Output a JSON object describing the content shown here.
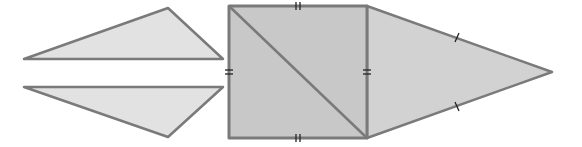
{
  "diagram": {
    "colors": {
      "stroke": "#7a7a7a",
      "light_fill": "#e2e2e2",
      "square_fill": "#c8c8c8",
      "right_fill": "#d2d2d2",
      "tick": "#222222"
    },
    "shapes": [
      {
        "id": "left-top-triangle",
        "points": "24,59 168,8 223,59",
        "fill": "light_fill"
      },
      {
        "id": "left-bottom-triangle",
        "points": "24,87 223,87 168,137",
        "fill": "light_fill"
      },
      {
        "id": "center-square",
        "points": "229,6 367,6 367,138 229,138",
        "fill": "square_fill"
      },
      {
        "id": "right-triangle",
        "points": "367,6 552,72 367,138",
        "fill": "right_fill"
      }
    ],
    "diagonal": {
      "x1": 229,
      "y1": 6,
      "x2": 367,
      "y2": 138
    },
    "tick_marks": {
      "double": [
        {
          "id": "square-top",
          "x": 298,
          "y": 6,
          "orientation": "vertical"
        },
        {
          "id": "square-bottom",
          "x": 298,
          "y": 138,
          "orientation": "vertical"
        },
        {
          "id": "square-left",
          "x": 229,
          "y": 72,
          "orientation": "horizontal"
        },
        {
          "id": "square-right",
          "x": 367,
          "y": 72,
          "orientation": "horizontal"
        }
      ],
      "single": [
        {
          "id": "right-upper-side",
          "x": 457,
          "y": 38
        },
        {
          "id": "right-lower-side",
          "x": 457,
          "y": 106
        }
      ]
    }
  }
}
